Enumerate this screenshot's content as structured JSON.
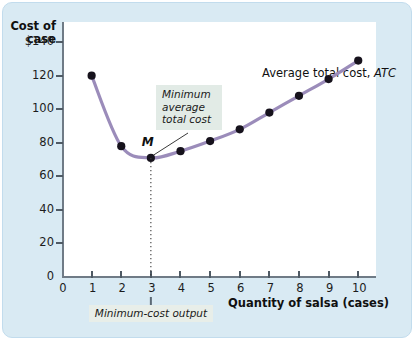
{
  "chart_data": {
    "type": "line",
    "title": "",
    "xlabel": "Quantity of salsa (cases)",
    "ylabel": "Cost of case",
    "series": [
      {
        "name": "Average total cost, ATC",
        "x": [
          1,
          2,
          3,
          4,
          5,
          6,
          7,
          8,
          9,
          10
        ],
        "values": [
          120,
          78,
          71,
          75,
          81,
          88,
          98,
          108,
          118,
          129
        ]
      }
    ],
    "x_ticks": [
      0,
      1,
      2,
      3,
      4,
      5,
      6,
      7,
      8,
      9,
      10
    ],
    "x_tick_labels": [
      "0",
      "1",
      "2",
      "3",
      "4",
      "5",
      "6",
      "7",
      "8",
      "9",
      "10"
    ],
    "y_ticks": [
      0,
      20,
      40,
      60,
      80,
      100,
      120,
      140
    ],
    "y_tick_labels": [
      "0",
      "20",
      "40",
      "60",
      "80",
      "100",
      "120",
      "$140"
    ],
    "xlim": [
      0,
      10.6
    ],
    "ylim": [
      0,
      152
    ],
    "grid": false,
    "legend_position": "inline-upper-right",
    "series_color": "#9b8cba",
    "marker_color": "#16121c",
    "panel_color": "#d9eaf3",
    "plot_color": "#ffffff",
    "annotations": [
      {
        "name": "minimum-average-total-cost",
        "text": "Minimum average total cost",
        "points_to_x": 3,
        "points_to_y": 71
      },
      {
        "name": "minimum-cost-output",
        "text": "Minimum-cost output",
        "points_to_x": 3
      },
      {
        "name": "point-m",
        "text": "M",
        "x": 3,
        "y": 71
      }
    ]
  },
  "axis": {
    "y_title_line1": "Cost of",
    "y_title_line2": "case",
    "x_title": "Quantity of salsa (cases)"
  },
  "legend": {
    "prefix": "Average total cost, ",
    "symbol": "ATC"
  },
  "callouts": {
    "min_atc_line1": "Minimum",
    "min_atc_line2": "average",
    "min_atc_line3": "total cost",
    "min_output": "Minimum-cost output",
    "point_m": "M"
  }
}
